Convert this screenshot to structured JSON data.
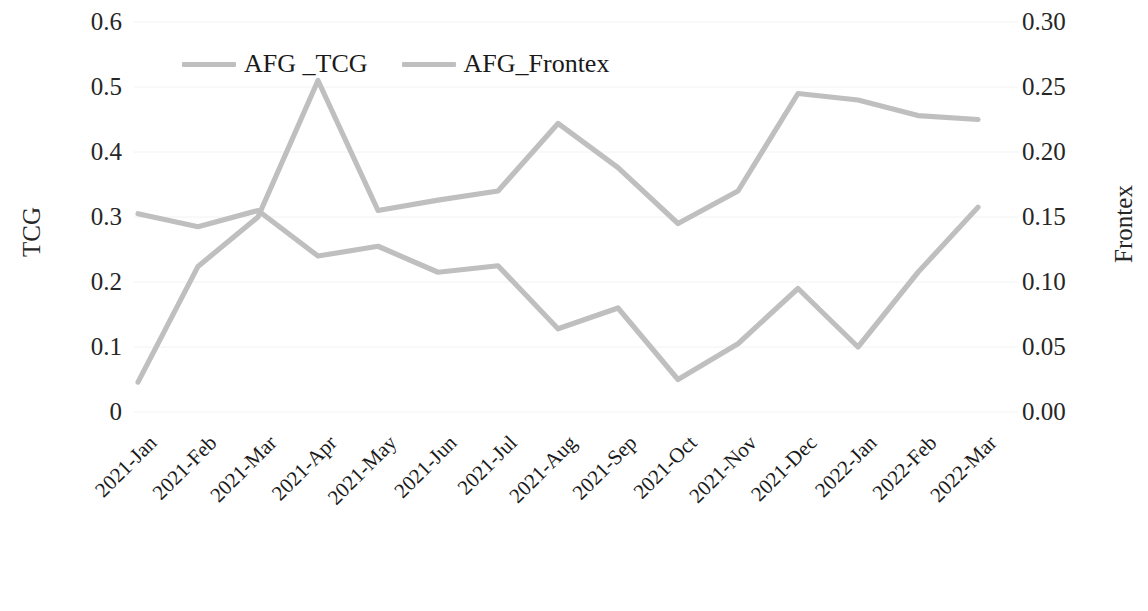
{
  "chart_data": {
    "type": "line",
    "title": "",
    "xlabel": "",
    "categories": [
      "2021-Jan",
      "2021-Feb",
      "2021-Mar",
      "2021-Apr",
      "2021-May",
      "2021-Jun",
      "2021-Jul",
      "2021-Aug",
      "2021-Sep",
      "2021-Oct",
      "2021-Nov",
      "2021-Dec",
      "2022-Jan",
      "2022-Feb",
      "2022-Mar"
    ],
    "series": [
      {
        "name": "AFG _TCG",
        "axis": "left",
        "color": "#bfbfbf",
        "values": [
          0.305,
          0.285,
          0.31,
          0.24,
          0.255,
          0.215,
          0.225,
          0.128,
          0.16,
          0.05,
          0.105,
          0.19,
          0.1,
          0.215,
          0.315
        ]
      },
      {
        "name": "AFG_Frontex",
        "axis": "right",
        "color": "#bfbfbf",
        "values": [
          0.023,
          0.112,
          0.15,
          0.255,
          0.155,
          0.163,
          0.17,
          0.222,
          0.188,
          0.145,
          0.17,
          0.245,
          0.24,
          0.228,
          0.225
        ]
      }
    ],
    "left_axis": {
      "label": "TCG",
      "ticks": [
        "0",
        "0.1",
        "0.2",
        "0.3",
        "0.4",
        "0.5",
        "0.6"
      ],
      "min": 0,
      "max": 0.6,
      "step": 0.1
    },
    "right_axis": {
      "label": "Frontex",
      "ticks": [
        "0.00",
        "0.05",
        "0.10",
        "0.15",
        "0.20",
        "0.25",
        "0.30"
      ],
      "min": 0,
      "max": 0.3,
      "step": 0.05
    },
    "legend": {
      "position": "top-left-inside",
      "entries": [
        "AFG _TCG",
        "AFG_Frontex"
      ]
    },
    "grid": true,
    "accent_color": "#bfbfbf"
  }
}
